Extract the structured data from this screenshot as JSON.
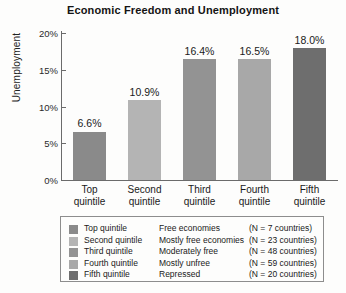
{
  "chart_data": {
    "type": "bar",
    "title": "Economic Freedom and Unemployment",
    "xlabel": "",
    "ylabel": "Unemployment",
    "categories": [
      "Top quintile",
      "Second quintile",
      "Third quintile",
      "Fourth quintile",
      "Fifth quintile"
    ],
    "category_lines": [
      [
        "Top",
        "quintile"
      ],
      [
        "Second",
        "quintile"
      ],
      [
        "Third",
        "quintile"
      ],
      [
        "Fourth",
        "quintile"
      ],
      [
        "Fifth",
        "quintile"
      ]
    ],
    "values": [
      6.6,
      10.9,
      16.4,
      16.5,
      18.0
    ],
    "value_labels": [
      "6.6%",
      "10.9%",
      "16.4%",
      "16.5%",
      "18.0%"
    ],
    "ylim": [
      0,
      20
    ],
    "ytick_values": [
      0,
      5,
      10,
      15,
      20
    ],
    "ytick_labels": [
      "0%",
      "5%",
      "10%",
      "15%",
      "20%"
    ],
    "grid": false,
    "legend_position": "below-plot",
    "bar_colors": [
      "#8a8a8a",
      "#b4b4b4",
      "#939393",
      "#a8a8a8",
      "#6e6e6e"
    ]
  },
  "legend": {
    "rows": [
      {
        "quintile": "Top quintile",
        "description": "Free economies",
        "count": "(N = 7 countries)",
        "color": "#8a8a8a"
      },
      {
        "quintile": "Second quintile",
        "description": "Mostly free economies",
        "count": "(N = 23 countries)",
        "color": "#b4b4b4"
      },
      {
        "quintile": "Third quintile",
        "description": "Moderately free",
        "count": "(N = 48 countries)",
        "color": "#939393"
      },
      {
        "quintile": "Fourth quintile",
        "description": "Mostly unfree",
        "count": "(N = 59 countries)",
        "color": "#a8a8a8"
      },
      {
        "quintile": "Fifth quintile",
        "description": "Repressed",
        "count": "(N = 20 countries)",
        "color": "#6e6e6e"
      }
    ]
  }
}
